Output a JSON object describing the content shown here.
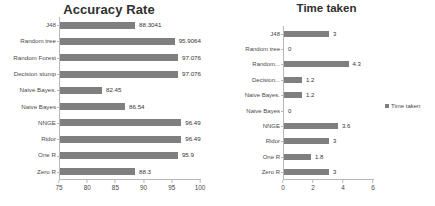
{
  "chart_data": [
    {
      "type": "bar",
      "orientation": "horizontal",
      "title": "Accuracy Rate",
      "xlabel": "",
      "ylabel": "",
      "xlim": [
        75,
        100
      ],
      "xticks": [
        75,
        80,
        85,
        90,
        95,
        100
      ],
      "grid": false,
      "legend": null,
      "bar_color": "#7f7f7f",
      "categories": [
        "J48",
        "Random tree",
        "Random Forest",
        "Decision stump",
        "Naive Bayes.",
        "Naive Bayes",
        "NNGE",
        "Ridor",
        "One R",
        "Zero R"
      ],
      "values": [
        88.3041,
        95.9064,
        97.076,
        97.076,
        82.45,
        86.54,
        96.49,
        96.49,
        95.9,
        88.3
      ],
      "value_labels": [
        "88.3041",
        "95.9064",
        "97.076",
        "97.076",
        "82.45",
        "86.54",
        "96.49",
        "96.49",
        "95.9",
        "88.3"
      ]
    },
    {
      "type": "bar",
      "orientation": "horizontal",
      "title": "Time taken",
      "xlabel": "",
      "ylabel": "",
      "xlim": [
        0,
        6
      ],
      "xticks": [
        0,
        2,
        4,
        6
      ],
      "grid": false,
      "legend": {
        "label": "Time taken",
        "position": "right",
        "marker_color": "#7f7f7f"
      },
      "bar_color": "#7f7f7f",
      "categories": [
        "J48",
        "Random tree",
        "Random...",
        "Decision...",
        "Naive Bayes.",
        "Naive Bayes",
        "NNGE",
        "Ridor",
        "One R",
        "Zero R"
      ],
      "values": [
        3,
        0,
        4.3,
        1.2,
        1.2,
        0,
        3.6,
        3,
        1.8,
        3
      ],
      "value_labels": [
        "3",
        "0",
        "4.3",
        "1.2",
        "1.2",
        "0",
        "3.6",
        "3",
        "1.8",
        "3"
      ]
    }
  ]
}
